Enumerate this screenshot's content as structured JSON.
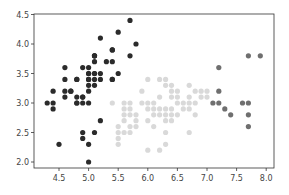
{
  "chart_data": {
    "type": "scatter",
    "title": "",
    "xlabel": "",
    "ylabel": "",
    "xlim": [
      4.2,
      8.05
    ],
    "ylim": [
      1.88,
      4.55
    ],
    "grid": false,
    "legend": "none",
    "xticks": [
      "4.5",
      "5.0",
      "5.5",
      "6.0",
      "6.5",
      "7.0",
      "7.5",
      "8.0"
    ],
    "yticks": [
      "2.0",
      "2.5",
      "3.0",
      "3.5",
      "4.0",
      "4.5"
    ],
    "series": [
      {
        "name": "cluster-0",
        "color": "#2b2b2b",
        "points": [
          [
            5.1,
            3.5
          ],
          [
            4.9,
            3.0
          ],
          [
            4.7,
            3.2
          ],
          [
            4.6,
            3.1
          ],
          [
            5.0,
            3.6
          ],
          [
            5.4,
            3.9
          ],
          [
            4.6,
            3.4
          ],
          [
            5.0,
            3.4
          ],
          [
            4.4,
            2.9
          ],
          [
            4.9,
            3.1
          ],
          [
            5.4,
            3.7
          ],
          [
            4.8,
            3.4
          ],
          [
            4.8,
            3.0
          ],
          [
            4.3,
            3.0
          ],
          [
            5.8,
            4.0
          ],
          [
            5.7,
            4.4
          ],
          [
            5.4,
            3.9
          ],
          [
            5.1,
            3.5
          ],
          [
            5.7,
            3.8
          ],
          [
            5.1,
            3.8
          ],
          [
            5.4,
            3.4
          ],
          [
            5.1,
            3.7
          ],
          [
            4.6,
            3.6
          ],
          [
            5.1,
            3.3
          ],
          [
            4.8,
            3.4
          ],
          [
            5.0,
            3.0
          ],
          [
            5.0,
            3.4
          ],
          [
            5.2,
            3.5
          ],
          [
            5.2,
            3.4
          ],
          [
            4.7,
            3.2
          ],
          [
            4.8,
            3.1
          ],
          [
            5.4,
            3.4
          ],
          [
            5.2,
            4.1
          ],
          [
            5.5,
            4.2
          ],
          [
            4.9,
            3.1
          ],
          [
            5.0,
            3.2
          ],
          [
            5.5,
            3.5
          ],
          [
            4.9,
            3.6
          ],
          [
            4.4,
            3.0
          ],
          [
            5.1,
            3.4
          ],
          [
            5.0,
            3.5
          ],
          [
            4.5,
            2.3
          ],
          [
            4.4,
            3.2
          ],
          [
            5.0,
            3.5
          ],
          [
            5.1,
            3.8
          ],
          [
            4.8,
            3.0
          ],
          [
            5.1,
            3.8
          ],
          [
            4.6,
            3.2
          ],
          [
            5.3,
            3.7
          ],
          [
            5.0,
            3.3
          ],
          [
            4.9,
            2.5
          ],
          [
            4.9,
            2.4
          ],
          [
            5.0,
            2.3
          ],
          [
            5.0,
            2.0
          ],
          [
            5.1,
            2.5
          ],
          [
            5.2,
            2.7
          ]
        ]
      },
      {
        "name": "cluster-1",
        "color": "#d9d9d9",
        "points": [
          [
            5.4,
            3.0
          ],
          [
            5.6,
            3.0
          ],
          [
            5.7,
            3.0
          ],
          [
            5.6,
            2.9
          ],
          [
            5.7,
            2.9
          ],
          [
            5.6,
            2.8
          ],
          [
            5.7,
            2.8
          ],
          [
            5.8,
            2.8
          ],
          [
            5.6,
            2.7
          ],
          [
            5.8,
            2.7
          ],
          [
            5.7,
            2.6
          ],
          [
            5.5,
            2.6
          ],
          [
            5.5,
            2.5
          ],
          [
            5.6,
            2.5
          ],
          [
            5.7,
            2.5
          ],
          [
            5.5,
            2.4
          ],
          [
            5.5,
            2.3
          ],
          [
            5.8,
            2.6
          ],
          [
            6.0,
            2.2
          ],
          [
            6.2,
            2.2
          ],
          [
            5.9,
            3.0
          ],
          [
            6.0,
            3.0
          ],
          [
            6.1,
            3.0
          ],
          [
            5.9,
            3.2
          ],
          [
            6.0,
            2.9
          ],
          [
            6.1,
            2.9
          ],
          [
            6.2,
            2.9
          ],
          [
            6.3,
            2.9
          ],
          [
            6.4,
            2.9
          ],
          [
            6.1,
            2.8
          ],
          [
            6.2,
            2.8
          ],
          [
            6.3,
            2.8
          ],
          [
            6.4,
            2.8
          ],
          [
            6.5,
            2.8
          ],
          [
            6.0,
            2.7
          ],
          [
            6.3,
            2.7
          ],
          [
            6.4,
            2.7
          ],
          [
            6.1,
            2.6
          ],
          [
            6.3,
            2.5
          ],
          [
            6.7,
            2.5
          ],
          [
            6.3,
            2.3
          ],
          [
            6.0,
            3.4
          ],
          [
            6.3,
            3.4
          ],
          [
            6.2,
            3.4
          ],
          [
            6.3,
            3.3
          ],
          [
            6.4,
            3.3
          ],
          [
            6.4,
            3.2
          ],
          [
            6.2,
            3.1
          ],
          [
            6.4,
            3.1
          ],
          [
            6.5,
            3.0
          ],
          [
            6.5,
            3.2
          ],
          [
            6.7,
            3.3
          ],
          [
            6.8,
            3.2
          ],
          [
            6.9,
            3.2
          ],
          [
            6.7,
            3.1
          ],
          [
            6.9,
            3.1
          ],
          [
            6.6,
            3.0
          ],
          [
            6.7,
            3.0
          ],
          [
            6.8,
            3.0
          ],
          [
            7.0,
            3.2
          ],
          [
            6.6,
            2.9
          ],
          [
            6.8,
            2.8
          ],
          [
            6.7,
            2.9
          ],
          [
            7.0,
            3.1
          ],
          [
            6.5,
            3.1
          ]
        ]
      },
      {
        "name": "cluster-2",
        "color": "#6f6f6f",
        "points": [
          [
            7.2,
            3.6
          ],
          [
            7.7,
            3.8
          ],
          [
            7.9,
            3.8
          ],
          [
            7.2,
            3.2
          ],
          [
            7.1,
            3.0
          ],
          [
            7.2,
            3.0
          ],
          [
            7.6,
            3.0
          ],
          [
            7.7,
            3.0
          ],
          [
            7.3,
            2.9
          ],
          [
            7.4,
            2.8
          ],
          [
            7.7,
            2.8
          ],
          [
            7.7,
            2.6
          ]
        ]
      }
    ]
  }
}
